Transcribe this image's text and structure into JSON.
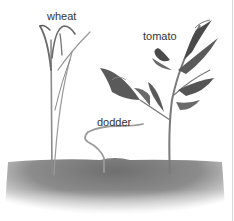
{
  "figure": {
    "labels": {
      "wheat": "wheat",
      "tomato": "tomato",
      "dodder": "dodder"
    },
    "colors": {
      "soil_dark": "#6f6f6f",
      "soil_light": "#d9d9d9",
      "leaf_dark": "#4a4a4a",
      "leaf_mid": "#7a7a7a",
      "stem": "#8a8a8a",
      "text": "#333333"
    }
  }
}
